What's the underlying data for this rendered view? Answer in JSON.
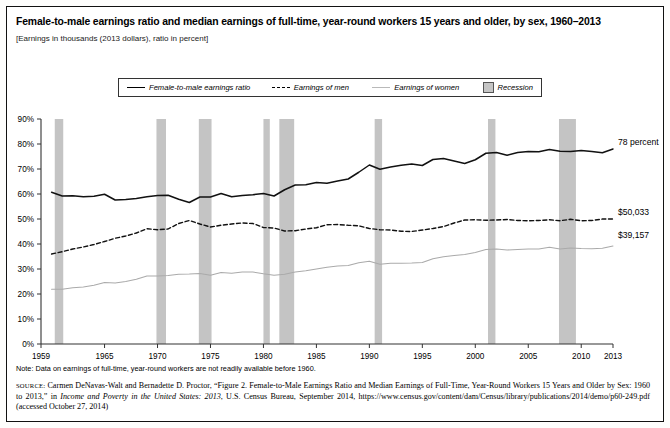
{
  "figure": {
    "title": "Female-to-male earnings ratio and median earnings of full-time, year-round workers 15 years and older, by sex, 1960–2013",
    "subtitle": "[Earnings in thousands (2013 dollars), ratio in percent]",
    "note": "Note: Data on earnings of full-time, year-round workers are not readily available before 1960.",
    "source_kw": "SOURCE:",
    "source_part1": " Carmen DeNavas-Walt and Bernadette D. Proctor, “Figure 2. Female-to-Male Earnings Ratio and Median Earnings of Full-Time, Year-Round Workers 15 Years and Older by Sex: 1960 to 2013,” in ",
    "source_italic": "Income and Poverty in the United States: 2013",
    "source_part2": ", U.S. Census Bureau, September 2014, https://www.census.gov/content/dam/Census/library/publications/2014/demo/p60-249.pdf (accessed October 27, 2014)"
  },
  "legend": {
    "items": [
      {
        "label": "Female-to-male earnings ratio",
        "style": "solid-black"
      },
      {
        "label": "Earnings of men",
        "style": "dashed-black"
      },
      {
        "label": "Earnings of women",
        "style": "solid-light"
      },
      {
        "label": "Recession",
        "style": "gray-box"
      }
    ]
  },
  "colors": {
    "ratio_line": "#111111",
    "men_line": "#111111",
    "women_line": "#aaaaaa",
    "recession_band": "#c4c4c4",
    "axis": "#333333"
  },
  "chart_data": {
    "type": "line",
    "title": "Female-to-male earnings ratio and median earnings of full-time, year-round workers 15 years and older, by sex, 1960–2013",
    "xlabel": "",
    "ylabel": "",
    "xlim": [
      1959,
      2013
    ],
    "ylim": [
      0,
      90
    ],
    "grid": false,
    "legend_position": "top-center",
    "ytick_labels": [
      "0%",
      "10%",
      "20%",
      "30%",
      "40%",
      "50%",
      "60%",
      "70%",
      "80%",
      "90%"
    ],
    "ytick_values": [
      0,
      10,
      20,
      30,
      40,
      50,
      60,
      70,
      80,
      90
    ],
    "xtick_labels": [
      "1959",
      "1965",
      "1970",
      "1975",
      "1980",
      "1985",
      "1990",
      "1995",
      "2000",
      "2005",
      "2010",
      "2013"
    ],
    "xtick_values": [
      1959,
      1965,
      1970,
      1975,
      1980,
      1985,
      1990,
      1995,
      2000,
      2005,
      2010,
      2013
    ],
    "x": [
      1960,
      1961,
      1962,
      1963,
      1964,
      1965,
      1966,
      1967,
      1968,
      1969,
      1970,
      1971,
      1972,
      1973,
      1974,
      1975,
      1976,
      1977,
      1978,
      1979,
      1980,
      1981,
      1982,
      1983,
      1984,
      1985,
      1986,
      1987,
      1988,
      1989,
      1990,
      1991,
      1992,
      1993,
      1994,
      1995,
      1996,
      1997,
      1998,
      1999,
      2000,
      2001,
      2002,
      2003,
      2004,
      2005,
      2006,
      2007,
      2008,
      2009,
      2010,
      2011,
      2012,
      2013
    ],
    "series": [
      {
        "name": "Female-to-male earnings ratio",
        "unit": "percent",
        "style": "solid-black",
        "end_label": "78 percent",
        "values": [
          60.7,
          59.2,
          59.3,
          58.9,
          59.1,
          59.9,
          57.6,
          57.8,
          58.2,
          58.9,
          59.4,
          59.5,
          57.9,
          56.6,
          58.8,
          58.8,
          60.2,
          58.9,
          59.4,
          59.7,
          60.2,
          59.2,
          61.7,
          63.6,
          63.7,
          64.6,
          64.3,
          65.2,
          66.0,
          68.7,
          71.6,
          69.9,
          70.8,
          71.5,
          72.0,
          71.4,
          73.8,
          74.2,
          73.2,
          72.2,
          73.7,
          76.3,
          76.6,
          75.5,
          76.6,
          77.0,
          76.9,
          77.8,
          77.1,
          77.0,
          77.4,
          77.0,
          76.5,
          78.0
        ]
      },
      {
        "name": "Earnings of men",
        "unit": "thousands of 2013 dollars",
        "style": "dashed-black",
        "end_label": "$50,033",
        "values": [
          36.0,
          36.9,
          38.0,
          38.8,
          39.8,
          41.0,
          42.3,
          43.2,
          44.4,
          46.1,
          45.7,
          46.0,
          48.2,
          49.4,
          48.0,
          46.8,
          47.5,
          48.0,
          48.4,
          48.2,
          46.6,
          46.4,
          45.2,
          45.3,
          46.0,
          46.5,
          47.7,
          47.8,
          47.5,
          47.3,
          46.2,
          45.7,
          45.6,
          45.1,
          45.0,
          45.6,
          46.2,
          47.0,
          48.4,
          49.6,
          49.7,
          49.5,
          49.6,
          49.8,
          49.4,
          49.3,
          49.4,
          49.7,
          49.3,
          49.9,
          49.3,
          49.4,
          50.0,
          50.0
        ]
      },
      {
        "name": "Earnings of women",
        "unit": "thousands of 2013 dollars",
        "style": "solid-light",
        "end_label": "$39,157",
        "values": [
          21.9,
          21.9,
          22.5,
          22.8,
          23.5,
          24.6,
          24.4,
          25.0,
          25.9,
          27.2,
          27.2,
          27.4,
          27.9,
          28.0,
          28.2,
          27.5,
          28.6,
          28.3,
          28.8,
          28.8,
          28.1,
          27.5,
          27.9,
          28.8,
          29.3,
          30.0,
          30.7,
          31.2,
          31.4,
          32.5,
          33.1,
          31.9,
          32.3,
          32.3,
          32.4,
          32.6,
          34.1,
          34.9,
          35.4,
          35.8,
          36.6,
          37.8,
          38.0,
          37.6,
          37.8,
          38.0,
          38.0,
          38.7,
          38.0,
          38.4,
          38.2,
          38.1,
          38.3,
          39.2
        ]
      }
    ],
    "recession_bands": [
      {
        "start": 1960.3,
        "end": 1961.1
      },
      {
        "start": 1969.9,
        "end": 1970.8
      },
      {
        "start": 1973.9,
        "end": 1975.1
      },
      {
        "start": 1980.0,
        "end": 1980.6
      },
      {
        "start": 1981.5,
        "end": 1982.9
      },
      {
        "start": 1990.5,
        "end": 1991.2
      },
      {
        "start": 2001.2,
        "end": 2001.9
      },
      {
        "start": 2007.9,
        "end": 2009.5
      }
    ]
  }
}
